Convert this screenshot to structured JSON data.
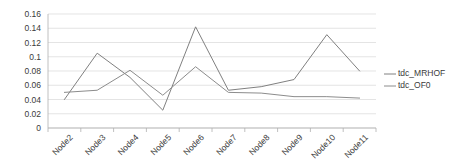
{
  "chart_data": {
    "type": "line",
    "title": "",
    "xlabel": "",
    "ylabel": "",
    "categories": [
      "Node2",
      "Node3",
      "Node4",
      "Node5",
      "Node6",
      "Node7",
      "Node8",
      "Node9",
      "Node10",
      "Node11"
    ],
    "ylim": [
      0,
      0.16
    ],
    "yticks": [
      "0",
      "0.02",
      "0.04",
      "0.06",
      "0.08",
      "0.1",
      "0.12",
      "0.14",
      "0.16"
    ],
    "ytick_values": [
      0,
      0.02,
      0.04,
      0.06,
      0.08,
      0.1,
      0.12,
      0.14,
      0.16
    ],
    "grid": true,
    "legend_position": "right",
    "series": [
      {
        "name": "tdc_MRHOF",
        "color": "#808080",
        "values": [
          0.04,
          0.105,
          0.071,
          0.025,
          0.142,
          0.053,
          0.058,
          0.068,
          0.131,
          0.08
        ]
      },
      {
        "name": "tdc_OF0",
        "color": "#8c8c8c",
        "values": [
          0.05,
          0.053,
          0.081,
          0.046,
          0.086,
          0.05,
          0.049,
          0.044,
          0.044,
          0.042
        ]
      }
    ]
  },
  "legend": {
    "items": [
      {
        "label": "tdc_MRHOF"
      },
      {
        "label": "tdc_OF0"
      }
    ]
  },
  "colors": {
    "grid": "#d9d9d9",
    "axis": "#b0b0b0",
    "text": "#3a3a3a",
    "background": "#ffffff"
  }
}
